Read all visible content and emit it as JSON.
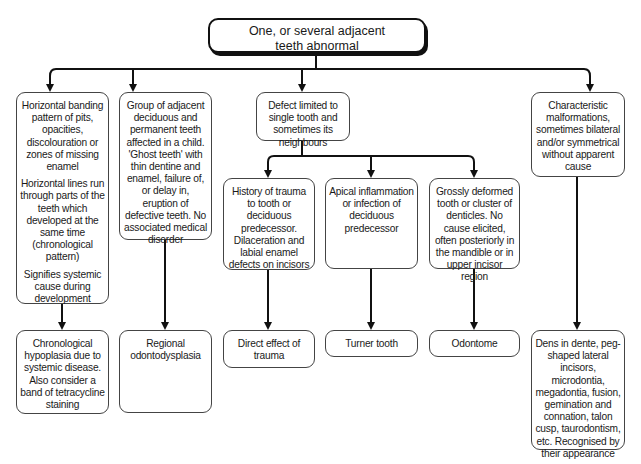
{
  "diagram": {
    "root": {
      "text": "One, or several adjacent teeth abnormal",
      "lines": [
        "One, or several adjacent",
        "teeth abnormal"
      ]
    },
    "level1": [
      {
        "id": "banding",
        "paragraphs": [
          "Horizontal banding pattern of pits, opacities, discolouration or zones of missing enamel",
          "Horizontal lines run through parts of the teeth which developed at the same time (chronological pattern)",
          "Signifies systemic cause during development"
        ],
        "outcome": "Chronological hypoplasia due to systemic disease. Also consider a band of tetracycline staining"
      },
      {
        "id": "group",
        "paragraphs": [
          "Group of adjacent deciduous and permanent teeth affected in a child. 'Ghost teeth' with thin dentine and enamel, failure of, or delay in, eruption of defective teeth. No associated medical disorder"
        ],
        "outcome": "Regional odontodysplasia"
      },
      {
        "id": "single",
        "paragraphs": [
          "Defect limited to single tooth and sometimes its neighbours"
        ],
        "children": [
          {
            "id": "trauma",
            "text": "History of trauma to tooth or deciduous predecessor. Dilaceration and labial enamel defects on incisors",
            "outcome": "Direct effect of trauma"
          },
          {
            "id": "apical",
            "text": "Apical inflammation or infection of deciduous predecessor",
            "outcome": "Turner tooth"
          },
          {
            "id": "deformed",
            "text": "Grossly deformed tooth or cluster of denticles. No cause elicited, often posteriorly in the mandible or in upper incisor region",
            "outcome": "Odontome"
          }
        ]
      },
      {
        "id": "malformations",
        "paragraphs": [
          "Characteristic malformations, sometimes bilateral and/or symmetrical without apparent cause"
        ],
        "outcome": "Dens in dente, peg-shaped lateral incisors, microdontia, megadontia, fusion, gemination and connation, talon cusp, taurodontism, etc. Recognised by their appearance"
      }
    ]
  },
  "colors": {
    "line": "#111111",
    "box_border": "#444444",
    "background": "#ffffff",
    "text": "#1a1a1a"
  }
}
